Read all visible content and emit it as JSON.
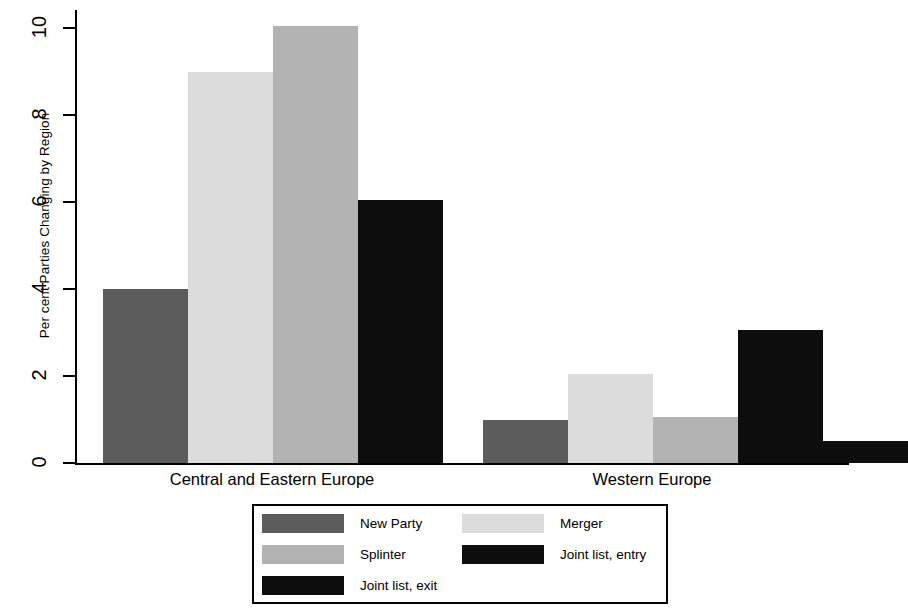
{
  "chart_data": {
    "type": "bar",
    "title": "",
    "xlabel": "",
    "ylabel": "Per cent Parties Changing by Region",
    "ylim": [
      0,
      10.5
    ],
    "yticks": [
      0,
      2,
      4,
      6,
      8,
      10
    ],
    "ytick_labels": [
      "0",
      "2",
      "4",
      "6",
      "8",
      "10"
    ],
    "grid": false,
    "legend_position": "bottom-center",
    "categories": [
      "Central and Eastern Europe",
      "Western Europe"
    ],
    "series": [
      {
        "name": "New Party",
        "color": "#5c5c5c",
        "values": [
          4.0,
          1.0
        ]
      },
      {
        "name": "Merger",
        "color": "#dcdcdc",
        "values": [
          9.0,
          2.05
        ]
      },
      {
        "name": "Splinter",
        "color": "#b3b3b3",
        "values": [
          10.05,
          1.05
        ]
      },
      {
        "name": "Joint list, entry",
        "color": "#0d0d0d",
        "values": [
          6.05,
          3.05
        ]
      },
      {
        "name": "Joint list, exit",
        "color": "#0d0d0d",
        "values": [
          0,
          0.5
        ]
      }
    ]
  },
  "axis": {
    "y_title": "Per cent Parties Changing by Region",
    "ticks": [
      {
        "label": "10",
        "value": 10
      },
      {
        "label": "8",
        "value": 8
      },
      {
        "label": "6",
        "value": 6
      },
      {
        "label": "4",
        "value": 4
      },
      {
        "label": "2",
        "value": 2
      },
      {
        "label": "0",
        "value": 0
      }
    ]
  },
  "categories": [
    {
      "label": "Central and Eastern Europe"
    },
    {
      "label": "Western Europe"
    }
  ],
  "legend": {
    "entries": [
      {
        "label": "New Party",
        "color": "#5c5c5c"
      },
      {
        "label": "Merger",
        "color": "#dcdcdc"
      },
      {
        "label": "Splinter",
        "color": "#b3b3b3"
      },
      {
        "label": "Joint list, entry",
        "color": "#0d0d0d"
      },
      {
        "label": "Joint list, exit",
        "color": "#0d0d0d"
      }
    ]
  }
}
